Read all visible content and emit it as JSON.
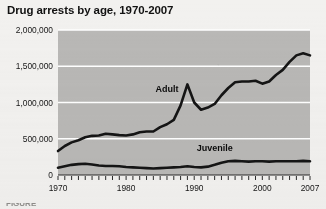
{
  "title": "Drug arrests by age, 1970-2007",
  "bottom_cropped_text": "FIGURE",
  "colors": {
    "plot_background": "#b9b8b6",
    "gridline": "#ffffff",
    "line": "#151515",
    "text": "#161616",
    "page_background": "#f2f1ef"
  },
  "chart_data": {
    "type": "line",
    "title": "Drug arrests by age, 1970-2007",
    "subtitle": "",
    "xlabel": "",
    "ylabel": "",
    "xlim": [
      1970,
      2007
    ],
    "ylim": [
      0,
      2000000
    ],
    "grid": "horizontal",
    "legend_position": "inline-annotation",
    "y_ticks": [
      0,
      500000,
      1000000,
      1500000,
      2000000
    ],
    "y_tick_labels": [
      "0",
      "500,000",
      "1,000,000",
      "1,500,000",
      "2,000,000"
    ],
    "x_ticks_labeled": [
      1970,
      1980,
      1990,
      2000,
      2007
    ],
    "x_tick_labels": [
      "1970",
      "1980",
      "1990",
      "2000",
      "2007"
    ],
    "x_minor_ticks_every": 1,
    "x": [
      1970,
      1971,
      1972,
      1973,
      1974,
      1975,
      1976,
      1977,
      1978,
      1979,
      1980,
      1981,
      1982,
      1983,
      1984,
      1985,
      1986,
      1987,
      1988,
      1989,
      1990,
      1991,
      1992,
      1993,
      1994,
      1995,
      1996,
      1997,
      1998,
      1999,
      2000,
      2001,
      2002,
      2003,
      2004,
      2005,
      2006,
      2007
    ],
    "series": [
      {
        "name": "Adult",
        "label": "Adult",
        "values": [
          330000,
          400000,
          450000,
          480000,
          520000,
          540000,
          545000,
          570000,
          560000,
          550000,
          545000,
          560000,
          590000,
          600000,
          600000,
          660000,
          700000,
          760000,
          960000,
          1250000,
          1000000,
          900000,
          930000,
          980000,
          1100000,
          1200000,
          1280000,
          1290000,
          1290000,
          1300000,
          1260000,
          1290000,
          1380000,
          1450000,
          1560000,
          1650000,
          1680000,
          1650000
        ]
      },
      {
        "name": "Juvenile",
        "label": "Juvenile",
        "values": [
          100000,
          120000,
          140000,
          150000,
          155000,
          145000,
          130000,
          125000,
          125000,
          120000,
          110000,
          105000,
          100000,
          95000,
          90000,
          95000,
          100000,
          105000,
          110000,
          120000,
          110000,
          105000,
          115000,
          140000,
          170000,
          190000,
          195000,
          190000,
          185000,
          190000,
          190000,
          185000,
          190000,
          190000,
          190000,
          190000,
          195000,
          190000
        ]
      }
    ],
    "annotations": [
      {
        "text": "Adult",
        "x": 1986,
        "y": 1150000
      },
      {
        "text": "Juvenile",
        "x": 1993,
        "y": 330000
      }
    ]
  }
}
